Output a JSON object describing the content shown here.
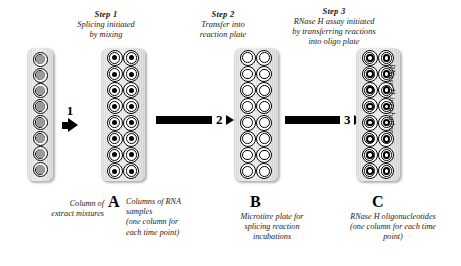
{
  "figure": {
    "background_color": "#ffffff",
    "ink_color": "#000000",
    "well_fill_gray": "#9a9a9a",
    "plate_body_color": "#e8e8e8"
  },
  "steps": [
    {
      "id": "step1",
      "title": "Step 1",
      "lines": [
        "Splicing initiated",
        "by mixing"
      ]
    },
    {
      "id": "step2",
      "title": "Step 2",
      "lines": [
        "Transfer into",
        "reaction plate"
      ]
    },
    {
      "id": "step3",
      "title": "Step 3",
      "lines": [
        "RNase H assay initiated",
        "by transferring reactions",
        "into oligo plate"
      ]
    }
  ],
  "arrows": [
    {
      "id": "arrow1",
      "number": "1"
    },
    {
      "id": "arrow2",
      "number": "2"
    },
    {
      "id": "arrow3",
      "number": "3"
    }
  ],
  "plates": [
    {
      "id": "strip",
      "letter": "",
      "columns": 1,
      "rows": 8,
      "well_style": "gray-filled",
      "caption_lines": [
        "Column of",
        "extract mixtures"
      ]
    },
    {
      "id": "a",
      "letter": "A",
      "columns": 2,
      "rows": 8,
      "well_style": "black-dot-centre",
      "caption_lines": [
        "Columns of RNA",
        "samples",
        "(one column for",
        "each time point)"
      ]
    },
    {
      "id": "b",
      "letter": "B",
      "columns": 2,
      "rows": 8,
      "well_style": "empty",
      "caption_lines": [
        "Microtitre plate for",
        "splicing reaction",
        "incubations"
      ]
    },
    {
      "id": "c",
      "letter": "C",
      "columns": 2,
      "rows": 8,
      "well_style": "ring-centre",
      "caption_lines": [
        "RNase H oligonucleotides",
        "(one column for each time",
        "point)"
      ]
    }
  ],
  "side_label": "RNase H incubation"
}
